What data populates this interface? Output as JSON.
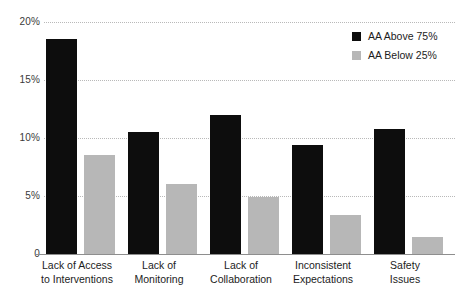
{
  "chart_data": {
    "type": "bar",
    "title": "",
    "subtitle": "",
    "xlabel": "",
    "ylabel": "",
    "ylim": [
      0,
      20
    ],
    "ytick_labels": [
      "20%",
      "15%",
      "10%",
      "5%",
      "0"
    ],
    "ytick_values": [
      20,
      15,
      10,
      5,
      0
    ],
    "grid": true,
    "legend_position": "top-right",
    "categories": [
      "Lack of Access to Interventions",
      "Lack of Monitoring",
      "Lack of Collaboration",
      "Inconsistent Expectations",
      "Safety Issues"
    ],
    "category_lines": [
      [
        "Lack of Access",
        "to Interventions"
      ],
      [
        "Lack of",
        "Monitoring"
      ],
      [
        "Lack of",
        "Collaboration"
      ],
      [
        "Inconsistent",
        "Expectations"
      ],
      [
        "Safety",
        "Issues"
      ]
    ],
    "series": [
      {
        "name": "AA Above 75%",
        "color": "#0d0d0d",
        "values": [
          18.5,
          10.5,
          12.0,
          9.4,
          10.8
        ]
      },
      {
        "name": "AA Below 25%",
        "color": "#b7b7b7",
        "values": [
          8.5,
          6.0,
          4.9,
          3.4,
          1.5
        ]
      }
    ]
  },
  "legend": {
    "items": [
      {
        "label": "AA Above 75%",
        "swatch": "legend-swatch-above"
      },
      {
        "label": "AA Below 25%",
        "swatch": "legend-swatch-below"
      }
    ]
  }
}
